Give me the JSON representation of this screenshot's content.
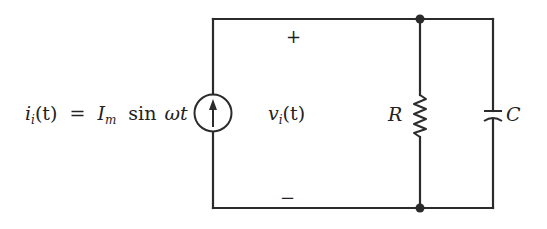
{
  "diagram": {
    "type": "circuit",
    "source": {
      "kind": "current-source",
      "label_lhs": "i",
      "label_lhs_sub": "i",
      "label_lhs_arg": "(t)",
      "equals": "=",
      "amplitude": "I",
      "amplitude_sub": "m",
      "function": "sin",
      "omega": "ω",
      "time": "t"
    },
    "voltage": {
      "symbol": "v",
      "sub": "i",
      "arg": "(t)",
      "plus": "+",
      "minus": "−"
    },
    "resistor": {
      "label": "R"
    },
    "capacitor": {
      "label": "C"
    },
    "topology": "current source in parallel with R and C"
  }
}
